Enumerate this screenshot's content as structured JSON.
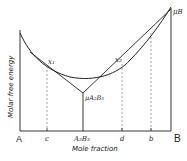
{
  "diagram": {
    "type": "free-energy-composition",
    "y_axis_label": "Molar free energy",
    "x_axis_label": "Mole fraction",
    "left_end_label": "A",
    "right_end_label": "B",
    "ticks": [
      {
        "label": "c"
      },
      {
        "label": "A₂B₃"
      },
      {
        "label": "d"
      },
      {
        "label": "b"
      }
    ],
    "points": {
      "x1": "x₁",
      "x2": "x₂",
      "mu_compound": "μA₂B₃",
      "mu_b": "μB"
    }
  },
  "colors": {
    "line": "#222222",
    "dashed": "#888888",
    "background": "#ffffff"
  }
}
